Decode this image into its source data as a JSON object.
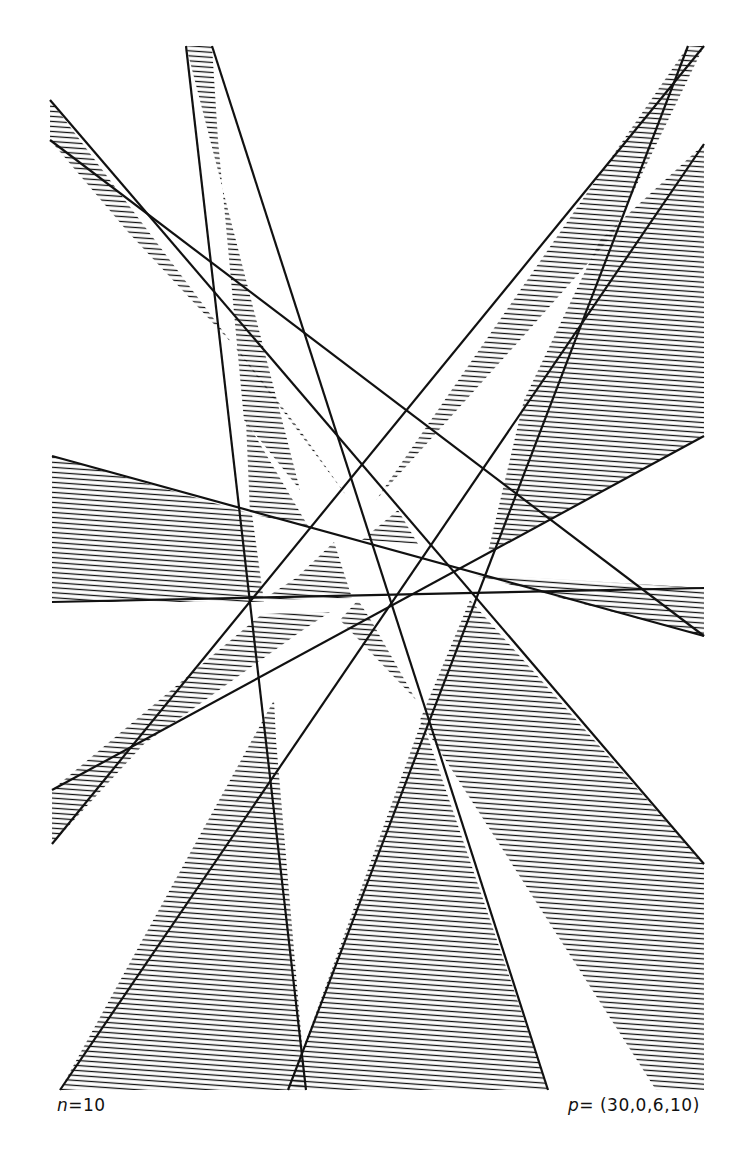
{
  "figure": {
    "type": "line-arrangement-hatched-regions",
    "background": "#ffffff",
    "ink_color": "#111111",
    "hatch_spacing_px": 5,
    "labels": {
      "n_var": "n",
      "n_value": "=10",
      "p_var": "p",
      "p_value": "= (30,0,6,10)"
    },
    "lines_count": 10,
    "wedges": [
      {
        "name": "left-wedge",
        "points": "52,456 52,602 264,602 252,514"
      },
      {
        "name": "top-left-sliver",
        "points": "50,100 50,140 128,232 240,352 300,430 348,498"
      },
      {
        "name": "top-center-sliver",
        "points": "186,46 212,46 218,140 244,420 300,490"
      },
      {
        "name": "top-right-sliver",
        "points": "688,46 704,46 612,236 520,340 376,500"
      },
      {
        "name": "right-big-wedge",
        "points": "704,144 704,436 488,552 524,400 600,240"
      },
      {
        "name": "right-thin-wedge",
        "points": "704,588 704,636 470,574"
      },
      {
        "name": "lower-left-wedge",
        "points": "52,790 52,844 144,744 300,632 330,612 262,614"
      },
      {
        "name": "bottom-left-wedge",
        "points": "60,1090 306,1090 276,740 274,700"
      },
      {
        "name": "bottom-center-wedge",
        "points": "288,1090 548,1090 422,720"
      },
      {
        "name": "bottom-right-wedge",
        "points": "470,600 704,864 704,1090 656,1090 420,720"
      },
      {
        "name": "center-wedge-a",
        "points": "296,578 334,542 352,598 262,600"
      },
      {
        "name": "center-wedge-b",
        "points": "246,420 250,514 308,526"
      },
      {
        "name": "center-wedge-c",
        "points": "340,620 358,600 372,622 416,700"
      },
      {
        "name": "center-wedge-d",
        "points": "362,540 398,510 418,544"
      }
    ],
    "lines": [
      {
        "x1": 50,
        "y1": 100,
        "x2": 704,
        "y2": 864
      },
      {
        "x1": 50,
        "y1": 140,
        "x2": 704,
        "y2": 636
      },
      {
        "x1": 186,
        "y1": 46,
        "x2": 306,
        "y2": 1090
      },
      {
        "x1": 212,
        "y1": 46,
        "x2": 548,
        "y2": 1090
      },
      {
        "x1": 704,
        "y1": 46,
        "x2": 52,
        "y2": 844
      },
      {
        "x1": 688,
        "y1": 46,
        "x2": 288,
        "y2": 1090
      },
      {
        "x1": 704,
        "y1": 144,
        "x2": 60,
        "y2": 1090
      },
      {
        "x1": 52,
        "y1": 602,
        "x2": 704,
        "y2": 588
      },
      {
        "x1": 52,
        "y1": 456,
        "x2": 704,
        "y2": 636
      },
      {
        "x1": 704,
        "y1": 436,
        "x2": 52,
        "y2": 790
      }
    ]
  }
}
